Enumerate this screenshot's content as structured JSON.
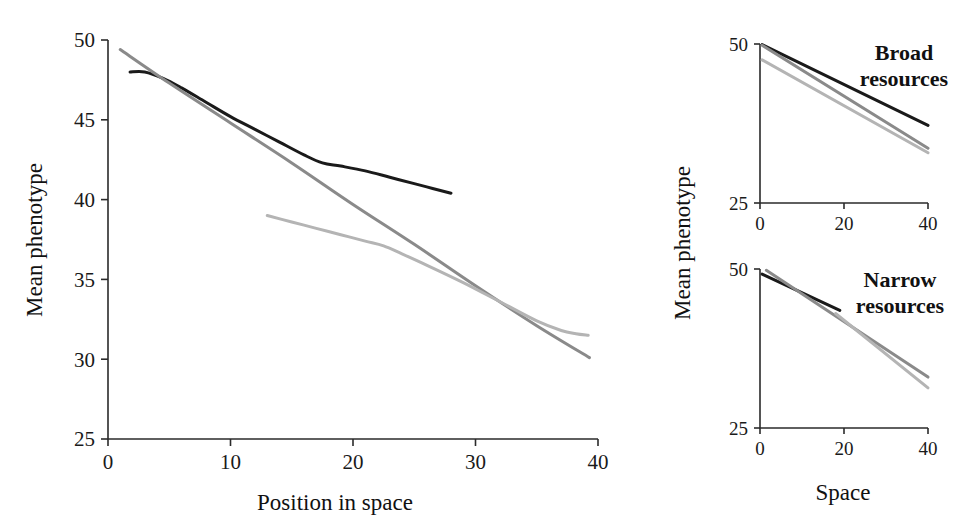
{
  "figure": {
    "background": "#ffffff",
    "panels": [
      "main",
      "broad",
      "narrow"
    ]
  },
  "colors": {
    "black_line": "#1a1a1a",
    "mid_gray_line": "#8a8a8a",
    "light_gray_line": "#b4b4b4",
    "axis": "#2b2b2b",
    "text": "#111111"
  },
  "main_panel": {
    "ylabel": "Mean phenotype",
    "xlabel": "Position in space",
    "ytick_labels": [
      "25",
      "30",
      "35",
      "40",
      "45",
      "50"
    ],
    "xtick_labels": [
      "0",
      "10",
      "20",
      "30",
      "40"
    ]
  },
  "broad_panel": {
    "annotation_line1": "Broad",
    "annotation_line2": "resources",
    "ytick_labels": [
      "25",
      "50"
    ],
    "xtick_labels": [
      "0",
      "20",
      "40"
    ]
  },
  "narrow_panel": {
    "annotation_line1": "Narrow",
    "annotation_line2": "resources",
    "ytick_labels": [
      "25",
      "50"
    ],
    "xtick_labels": [
      "0",
      "20",
      "40"
    ]
  },
  "right_column": {
    "ylabel": "Mean phenotype",
    "xlabel": "Space"
  },
  "chart_data": [
    {
      "type": "line",
      "id": "main",
      "title": "",
      "xlabel": "Position in space",
      "ylabel": "Mean phenotype",
      "xlim": [
        0,
        40
      ],
      "ylim": [
        25,
        50
      ],
      "xticks": [
        0,
        10,
        20,
        30,
        40
      ],
      "yticks": [
        25,
        30,
        35,
        40,
        45,
        50
      ],
      "grid": false,
      "legend": "none",
      "series": [
        {
          "name": "black-curve",
          "color": "#1a1a1a",
          "width": 3.0,
          "x": [
            1.8,
            3.0,
            4.5,
            6.0,
            8.0,
            10.0,
            12.0,
            14.0,
            16.0,
            17.5,
            19.0,
            21.0,
            23.0,
            25.0,
            26.5,
            28.0
          ],
          "y": [
            48.0,
            48.0,
            47.6,
            47.0,
            46.1,
            45.2,
            44.4,
            43.6,
            42.8,
            42.3,
            42.1,
            41.8,
            41.4,
            41.0,
            40.7,
            40.4
          ]
        },
        {
          "name": "mid-gray-straight-line",
          "color": "#8a8a8a",
          "width": 3.0,
          "x": [
            1.0,
            5.0,
            10.0,
            15.0,
            20.0,
            25.0,
            30.0,
            35.0,
            39.3
          ],
          "y": [
            49.4,
            47.3,
            44.8,
            42.3,
            39.7,
            37.2,
            34.6,
            32.1,
            30.1
          ]
        },
        {
          "name": "light-gray-curve",
          "color": "#b4b4b4",
          "width": 3.0,
          "x": [
            13.0,
            15.0,
            17.0,
            19.0,
            21.0,
            22.5,
            24.0,
            26.0,
            29.0,
            32.0,
            35.0,
            37.0,
            38.2,
            39.2
          ],
          "y": [
            39.0,
            38.6,
            38.2,
            37.8,
            37.4,
            37.1,
            36.6,
            35.9,
            34.8,
            33.6,
            32.4,
            31.8,
            31.6,
            31.5
          ]
        }
      ]
    },
    {
      "type": "line",
      "id": "broad",
      "title": "Broad resources",
      "xlabel": "Space",
      "ylabel": "Mean phenotype",
      "xlim": [
        0,
        40
      ],
      "ylim": [
        25,
        50
      ],
      "xticks": [
        0,
        20,
        40
      ],
      "yticks": [
        25,
        50
      ],
      "grid": false,
      "legend": "none",
      "series": [
        {
          "name": "black-line",
          "color": "#1a1a1a",
          "width": 3.0,
          "x": [
            0.5,
            40.0
          ],
          "y": [
            49.9,
            37.2
          ]
        },
        {
          "name": "mid-gray-line",
          "color": "#8a8a8a",
          "width": 3.0,
          "x": [
            0.5,
            40.0
          ],
          "y": [
            49.8,
            33.6
          ]
        },
        {
          "name": "light-gray-line",
          "color": "#b4b4b4",
          "width": 3.0,
          "x": [
            0.5,
            40.0
          ],
          "y": [
            47.5,
            32.9
          ]
        }
      ]
    },
    {
      "type": "line",
      "id": "narrow",
      "title": "Narrow resources",
      "xlabel": "Space",
      "ylabel": "Mean phenotype",
      "xlim": [
        0,
        40
      ],
      "ylim": [
        25,
        50
      ],
      "xticks": [
        0,
        20,
        40
      ],
      "yticks": [
        25,
        50
      ],
      "grid": false,
      "legend": "none",
      "series": [
        {
          "name": "black-line",
          "color": "#1a1a1a",
          "width": 3.0,
          "x": [
            0.5,
            19.0
          ],
          "y": [
            49.2,
            43.5
          ]
        },
        {
          "name": "mid-gray-line",
          "color": "#8a8a8a",
          "width": 3.0,
          "x": [
            1.5,
            40.0
          ],
          "y": [
            49.8,
            33.0
          ]
        },
        {
          "name": "light-gray-line",
          "color": "#b4b4b4",
          "width": 3.0,
          "x": [
            18.0,
            40.0
          ],
          "y": [
            43.0,
            31.3
          ]
        }
      ]
    }
  ]
}
